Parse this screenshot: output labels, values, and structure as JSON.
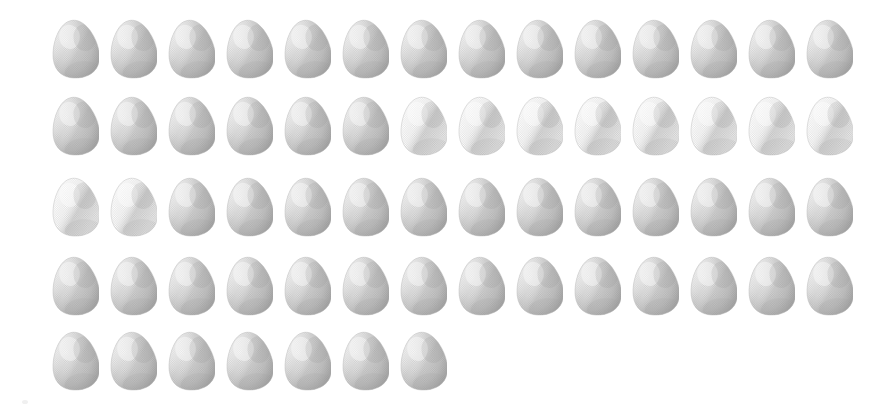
{
  "scene": {
    "title": "Egg Grid",
    "description": "Grid of illustrated chicken eggs on a plain white background",
    "background_color": "#ffffff",
    "width": 886,
    "height": 418,
    "total_count": 63
  },
  "egg_style": {
    "icon_name": "egg-icon",
    "width": 47,
    "height": 61,
    "base_color": "#c9c9c9",
    "highlight_color": "#eeeeee",
    "shadow_color": "#a6a6a6",
    "edge_color": "#bdbdbd",
    "texture": "halftone-dots",
    "rotation_deg": -6
  },
  "grid": {
    "rows": [
      {
        "label": "row-1",
        "count": 14,
        "x": 52,
        "y": 18
      },
      {
        "label": "row-2",
        "count": 14,
        "x": 52,
        "y": 95
      },
      {
        "label": "row-3",
        "count": 14,
        "x": 52,
        "y": 176
      },
      {
        "label": "row-4",
        "count": 14,
        "x": 52,
        "y": 255
      },
      {
        "label": "row-5",
        "count": 7,
        "x": 52,
        "y": 330
      }
    ],
    "column_pitch": 58,
    "row_pitch": 77
  },
  "artifacts": [
    {
      "name": "scan-speck",
      "x": 22,
      "y": 400,
      "w": 6,
      "h": 4
    }
  ]
}
